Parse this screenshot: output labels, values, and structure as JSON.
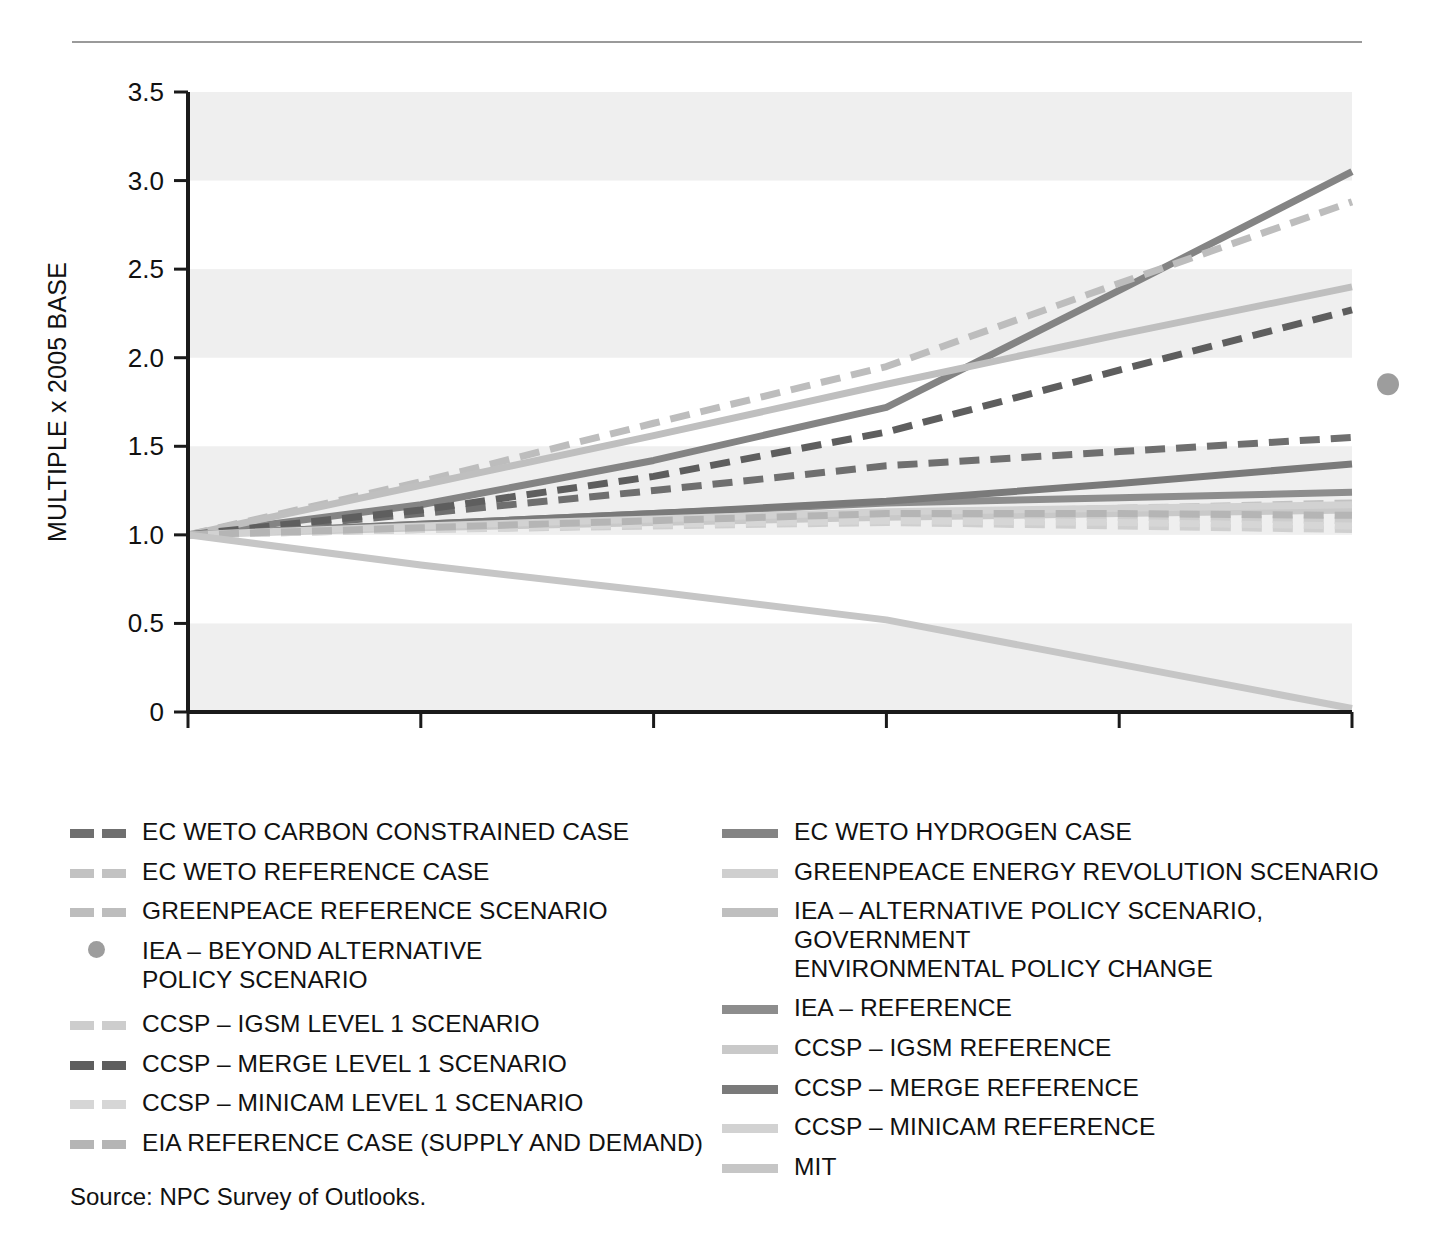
{
  "figure": {
    "source_note": "Source: NPC Survey of Outlooks."
  },
  "chart_data": {
    "type": "line",
    "title": "",
    "xlabel": "YEAR",
    "ylabel": "MULTIPLE x 2005 BASE",
    "xlim": [
      2005,
      2030
    ],
    "ylim": [
      0,
      3.5
    ],
    "xticks": [
      "2005",
      "2010",
      "2015",
      "2020",
      "2025",
      "2030"
    ],
    "yticks": [
      "0",
      "0.5",
      "1.0",
      "1.5",
      "2.0",
      "2.5",
      "3.0",
      "3.5"
    ],
    "grid": false,
    "banded_background": true,
    "band_ranges": [
      [
        0,
        0.5
      ],
      [
        1.0,
        1.5
      ],
      [
        2.0,
        2.5
      ],
      [
        3.0,
        3.5
      ]
    ],
    "band_color": "#efefef",
    "legend_position": "below",
    "x": [
      2005,
      2010,
      2015,
      2020,
      2025,
      2030
    ],
    "series": [
      {
        "name": "EC WETO CARBON CONSTRAINED CASE",
        "style": "dashed",
        "color": "#6f6f6f",
        "values": [
          1.0,
          1.12,
          1.25,
          1.39,
          1.47,
          1.55
        ]
      },
      {
        "name": "EC WETO HYDROGEN CASE",
        "style": "solid",
        "color": "#848484",
        "values": [
          1.0,
          1.17,
          1.42,
          1.72,
          2.38,
          3.05
        ]
      },
      {
        "name": "EC WETO REFERENCE CASE",
        "style": "dashed",
        "color": "#c2c2c2",
        "values": [
          1.0,
          1.05,
          1.09,
          1.12,
          1.15,
          1.18
        ]
      },
      {
        "name": "GREENPEACE ENERGY REVOLUTION SCENARIO",
        "style": "dashed",
        "color": "#cfcfcf",
        "values": [
          1.0,
          1.03,
          1.05,
          1.07,
          1.05,
          1.03
        ]
      },
      {
        "name": "GREENPEACE REFERENCE SCENARIO",
        "style": "dashed",
        "color": "#bdbdbd",
        "values": [
          1.0,
          1.3,
          1.63,
          1.95,
          2.42,
          2.88
        ]
      },
      {
        "name": "IEA – ALTERNATIVE POLICY SCENARIO, GOVERNMENT ENVIRONMENTAL POLICY CHANGE",
        "style": "solid",
        "color": "#bfbfbf",
        "values": [
          1.0,
          1.28,
          1.56,
          1.85,
          2.13,
          2.4
        ]
      },
      {
        "name": "IEA – BEYOND ALTERNATIVE POLICY SCENARIO",
        "style": "dot",
        "color": "#9d9d9d",
        "values": [
          null,
          null,
          null,
          null,
          null,
          1.85
        ]
      },
      {
        "name": "IEA – REFERENCE",
        "style": "solid",
        "color": "#8d8d8d",
        "values": [
          1.0,
          1.06,
          1.12,
          1.18,
          1.21,
          1.24
        ]
      },
      {
        "name": "CCSP – IGSM LEVEL 1 SCENARIO",
        "style": "dashed",
        "color": "#cdcdcd",
        "values": [
          1.0,
          1.04,
          1.08,
          1.11,
          1.1,
          1.08
        ]
      },
      {
        "name": "CCSP – IGSM REFERENCE",
        "style": "solid",
        "color": "#c9c9c9",
        "values": [
          1.0,
          1.04,
          1.07,
          1.1,
          1.12,
          1.14
        ]
      },
      {
        "name": "CCSP – MERGE LEVEL 1 SCENARIO",
        "style": "dashed",
        "color": "#5e5e5e",
        "values": [
          1.0,
          1.14,
          1.33,
          1.58,
          1.93,
          2.27
        ]
      },
      {
        "name": "CCSP – MERGE REFERENCE",
        "style": "solid",
        "color": "#7a7a7a",
        "values": [
          1.0,
          1.06,
          1.12,
          1.19,
          1.29,
          1.4
        ]
      },
      {
        "name": "CCSP – MINICAM LEVEL 1 SCENARIO",
        "style": "dashed",
        "color": "#d6d6d6",
        "values": [
          1.0,
          1.03,
          1.06,
          1.08,
          1.07,
          1.05
        ]
      },
      {
        "name": "CCSP – MINICAM REFERENCE",
        "style": "solid",
        "color": "#d2d2d2",
        "values": [
          1.0,
          1.05,
          1.09,
          1.13,
          1.15,
          1.17
        ]
      },
      {
        "name": "EIA REFERENCE CASE (SUPPLY AND DEMAND)",
        "style": "dashed",
        "color": "#b5b5b5",
        "values": [
          1.0,
          1.04,
          1.08,
          1.12,
          1.12,
          1.11
        ]
      },
      {
        "name": "MIT",
        "style": "solid",
        "color": "#c6c6c6",
        "values": [
          1.0,
          0.83,
          0.68,
          0.52,
          0.27,
          0.02
        ]
      }
    ]
  },
  "legend": {
    "left_column": [
      {
        "label": "EC WETO CARBON CONSTRAINED CASE",
        "style": "dashed",
        "color": "#6f6f6f"
      },
      {
        "label": "EC WETO REFERENCE CASE",
        "style": "dashed",
        "color": "#c2c2c2"
      },
      {
        "label": "GREENPEACE REFERENCE SCENARIO",
        "style": "dashed",
        "color": "#bdbdbd"
      },
      {
        "label": "IEA – BEYOND ALTERNATIVE\n    POLICY SCENARIO",
        "style": "dot",
        "color": "#9d9d9d"
      },
      {
        "label": "CCSP – IGSM LEVEL 1 SCENARIO",
        "style": "dashed",
        "color": "#cdcdcd"
      },
      {
        "label": "CCSP – MERGE LEVEL 1 SCENARIO",
        "style": "dashed",
        "color": "#5e5e5e"
      },
      {
        "label": "CCSP – MINICAM LEVEL 1 SCENARIO",
        "style": "dashed",
        "color": "#d6d6d6"
      },
      {
        "label": "EIA REFERENCE CASE (SUPPLY AND DEMAND)",
        "style": "dashed",
        "color": "#b5b5b5"
      }
    ],
    "right_column": [
      {
        "label": "EC WETO HYDROGEN CASE",
        "style": "solid",
        "color": "#848484"
      },
      {
        "label": "GREENPEACE ENERGY REVOLUTION SCENARIO",
        "style": "solid",
        "color": "#cfcfcf"
      },
      {
        "label": "IEA – ALTERNATIVE POLICY SCENARIO, GOVERNMENT\n        ENVIRONMENTAL POLICY CHANGE",
        "style": "solid",
        "color": "#bfbfbf"
      },
      {
        "label": "IEA – REFERENCE",
        "style": "solid",
        "color": "#8d8d8d"
      },
      {
        "label": "CCSP – IGSM REFERENCE",
        "style": "solid",
        "color": "#c9c9c9"
      },
      {
        "label": "CCSP – MERGE REFERENCE",
        "style": "solid",
        "color": "#7a7a7a"
      },
      {
        "label": "CCSP – MINICAM REFERENCE",
        "style": "solid",
        "color": "#d2d2d2"
      },
      {
        "label": "MIT",
        "style": "solid",
        "color": "#c6c6c6"
      }
    ]
  }
}
